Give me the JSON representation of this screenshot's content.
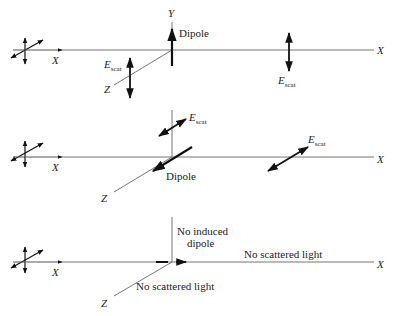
{
  "panels": [
    {
      "id": "panel-1",
      "axis_labels": {
        "x_left": "X",
        "x_right": "X",
        "y": "Y",
        "z": "Z"
      },
      "dipole_label": "Dipole",
      "escat_labels": [
        {
          "E": "E",
          "sub": "scat"
        },
        {
          "E": "E",
          "sub": "scat"
        }
      ]
    },
    {
      "id": "panel-2",
      "axis_labels": {
        "x_left": "X",
        "x_right": "X",
        "z": "Z"
      },
      "dipole_label": "Dipole",
      "escat_labels": [
        {
          "E": "E",
          "sub": "scat"
        },
        {
          "E": "E",
          "sub": "scat"
        }
      ]
    },
    {
      "id": "panel-3",
      "axis_labels": {
        "x_left": "X",
        "x_right": "X",
        "z": "Z"
      },
      "induced_label_line1": "No induced",
      "induced_label_line2": "dipole",
      "no_scatter_x": "No scattered light",
      "no_scatter_z": "No scattered light"
    }
  ],
  "colors": {
    "line": "#555555",
    "arrow": "#111111",
    "text": "#222222"
  }
}
